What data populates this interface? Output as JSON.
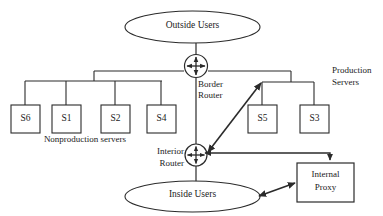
{
  "diagram": {
    "stroke_color": "#2b2b2b",
    "text_color": "#1a1a1a",
    "background_color": "#ffffff",
    "clouds": [
      {
        "id": "outside-users",
        "label": "Outside Users"
      },
      {
        "id": "inside-users",
        "label": "Inside Users"
      }
    ],
    "routers": [
      {
        "id": "border-router",
        "label_line1": "Border",
        "label_line2": "Router"
      },
      {
        "id": "interior-router",
        "label_line1": "Interior",
        "label_line2": "Router"
      }
    ],
    "nonproduction": {
      "caption": "Nonproduction servers",
      "servers": [
        {
          "id": "s6",
          "label": "S6"
        },
        {
          "id": "s1",
          "label": "S1"
        },
        {
          "id": "s2",
          "label": "S2"
        },
        {
          "id": "s4",
          "label": "S4"
        }
      ]
    },
    "production": {
      "caption_line1": "Production",
      "caption_line2": "Servers",
      "servers": [
        {
          "id": "s5",
          "label": "S5"
        },
        {
          "id": "s3",
          "label": "S3"
        }
      ]
    },
    "proxy": {
      "id": "internal-proxy",
      "label_line1": "Internal",
      "label_line2": "Proxy"
    },
    "connections": [
      {
        "from": "outside-users",
        "to": "border-router",
        "style": "plain-line"
      },
      {
        "from": "border-router",
        "to": "nonproduction-bus",
        "style": "plain-line"
      },
      {
        "from": "border-router",
        "to": "production-bus",
        "style": "plain-line"
      },
      {
        "from": "border-router",
        "to": "interior-router",
        "style": "plain-line"
      },
      {
        "from": "interior-router",
        "to": "production-bus",
        "style": "double-arrow"
      },
      {
        "from": "interior-router",
        "to": "internal-proxy",
        "style": "single-arrow"
      },
      {
        "from": "inside-users",
        "to": "internal-proxy",
        "style": "double-arrow"
      },
      {
        "from": "interior-router",
        "to": "inside-users",
        "style": "plain-line"
      }
    ]
  }
}
